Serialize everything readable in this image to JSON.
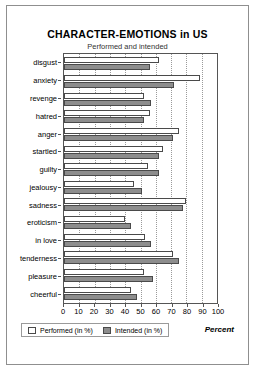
{
  "chart_data": {
    "type": "bar",
    "orientation": "horizontal",
    "title": "CHARACTER-EMOTIONS in US",
    "subtitle": "Performed and intended",
    "xlabel": "Percent",
    "ylabel": "",
    "xlim": [
      0,
      100
    ],
    "xticks": [
      0,
      10,
      20,
      30,
      40,
      50,
      60,
      70,
      80,
      90,
      100
    ],
    "grid": "vertical-dotted",
    "legend_position": "bottom-left",
    "categories": [
      "disgust",
      "anxiety",
      "revenge",
      "hatred",
      "anger",
      "startled",
      "guilty",
      "jealousy",
      "sadness",
      "eroticism",
      "in love",
      "tenderness",
      "pleasure",
      "cheerful"
    ],
    "series": [
      {
        "name": "Performed (in %)",
        "color": "#ffffff",
        "values": [
          62,
          89,
          52,
          56,
          75,
          65,
          55,
          46,
          80,
          40,
          53,
          71,
          52,
          44
        ]
      },
      {
        "name": "Intended (in %)",
        "color": "#8d8d8d",
        "values": [
          56,
          72,
          57,
          52,
          71,
          62,
          62,
          51,
          78,
          44,
          57,
          75,
          58,
          48
        ]
      }
    ]
  }
}
